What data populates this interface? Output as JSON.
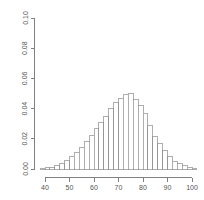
{
  "chart_data": {
    "type": "bar",
    "subtype": "histogram",
    "title": "",
    "subtitle": "",
    "xlabel": "",
    "ylabel": "",
    "xlim": [
      37,
      103
    ],
    "ylim": [
      0.0,
      0.1
    ],
    "grid": false,
    "legend": null,
    "bin_width": 2,
    "x_ticks": [
      40,
      50,
      60,
      70,
      80,
      90,
      100
    ],
    "x_tick_labels": [
      "40",
      "50",
      "60",
      "70",
      "80",
      "90",
      "100"
    ],
    "y_ticks": [
      0.0,
      0.02,
      0.04,
      0.06,
      0.08,
      0.1
    ],
    "y_tick_labels": [
      "0.00",
      "0.02",
      "0.04",
      "0.06",
      "0.08",
      "0.10"
    ],
    "bin_edges": [
      38,
      40,
      42,
      44,
      46,
      48,
      50,
      52,
      54,
      56,
      58,
      60,
      62,
      64,
      66,
      68,
      70,
      72,
      74,
      76,
      78,
      80,
      82,
      84,
      86,
      88,
      90,
      92,
      94,
      96,
      98,
      100,
      102
    ],
    "bin_centers": [
      39,
      41,
      43,
      45,
      47,
      49,
      51,
      53,
      55,
      57,
      59,
      61,
      63,
      65,
      67,
      69,
      71,
      73,
      75,
      77,
      79,
      81,
      83,
      85,
      87,
      89,
      91,
      93,
      95,
      97,
      99,
      101
    ],
    "values": [
      0.0005,
      0.0008,
      0.0013,
      0.0022,
      0.0035,
      0.0055,
      0.008,
      0.011,
      0.0145,
      0.0185,
      0.0225,
      0.0265,
      0.031,
      0.035,
      0.04,
      0.044,
      0.047,
      0.0495,
      0.05,
      0.046,
      0.042,
      0.037,
      0.029,
      0.0215,
      0.017,
      0.012,
      0.0085,
      0.005,
      0.0035,
      0.002,
      0.001,
      0.0005
    ],
    "peak_value": 0.05,
    "peak_bin_center": 75
  },
  "axes": {
    "y_axis_name": "density-axis",
    "x_axis_name": "value-axis"
  }
}
